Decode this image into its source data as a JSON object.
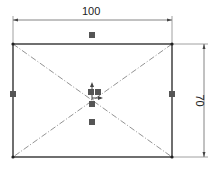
{
  "sketch": {
    "rectangle": {
      "x1": 13,
      "y1": 44,
      "x2": 172,
      "y2": 157,
      "stroke": "#333333"
    },
    "construction_lines_color": "#777777",
    "relation_marker_color": "#555555",
    "dimensions": {
      "horizontal": {
        "value": "100",
        "y": 20,
        "x1": 13,
        "x2": 172
      },
      "vertical": {
        "value": "70",
        "x": 204,
        "y1": 44,
        "y2": 157
      }
    },
    "midpoint_markers": [
      {
        "name": "top",
        "x": 92,
        "y": 35
      },
      {
        "name": "bottom",
        "x": 92,
        "y": 122
      },
      {
        "name": "left",
        "x": 13,
        "y": 94
      },
      {
        "name": "right",
        "x": 172,
        "y": 94
      }
    ],
    "center_cluster": {
      "origin": {
        "x": 92,
        "y": 100
      },
      "icons": [
        "arrow-up-icon",
        "coincident-square-icon",
        "coincident-square-icon",
        "arrow-right-icon",
        "coincident-square-icon"
      ]
    }
  }
}
